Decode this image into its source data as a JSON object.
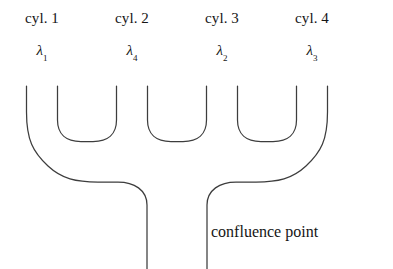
{
  "figure": {
    "type": "microfluidic-channel-schematic",
    "background_color": "#ffffff",
    "line_color": "#3d3d3d",
    "text_color": "#151515"
  },
  "cylinders": [
    {
      "label": "cyl. 1",
      "wavelength": "λ",
      "subscript": "1",
      "center_x": 42
    },
    {
      "label": "cyl. 2",
      "wavelength": "λ",
      "subscript": "4",
      "center_x": 132
    },
    {
      "label": "cyl. 3",
      "wavelength": "λ",
      "subscript": "2",
      "center_x": 222
    },
    {
      "label": "cyl. 4",
      "wavelength": "λ",
      "subscript": "3",
      "center_x": 312
    }
  ],
  "annotations": {
    "confluence_point": "confluence point"
  }
}
